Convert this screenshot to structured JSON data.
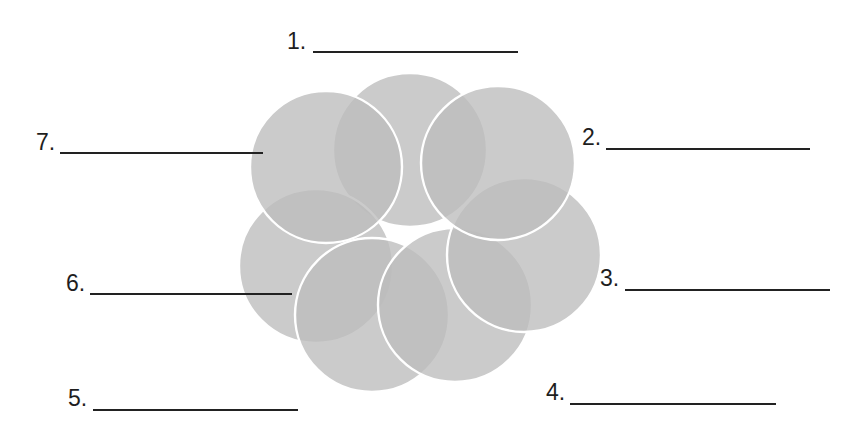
{
  "diagram": {
    "title": "",
    "circle_count": 7,
    "fill_color": "#bdbdbd",
    "outline_color": "#ffffff",
    "line_color": "#222222",
    "labels": [
      {
        "number": "1.",
        "answer": ""
      },
      {
        "number": "2.",
        "answer": ""
      },
      {
        "number": "3.",
        "answer": ""
      },
      {
        "number": "4.",
        "answer": ""
      },
      {
        "number": "5.",
        "answer": ""
      },
      {
        "number": "6.",
        "answer": ""
      },
      {
        "number": "7.",
        "answer": ""
      }
    ]
  }
}
